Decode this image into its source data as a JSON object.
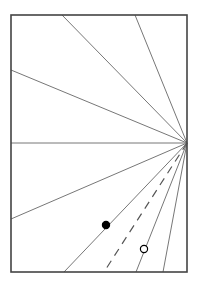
{
  "diagram": {
    "width": 201,
    "height": 283,
    "frame": {
      "x1": 11,
      "y1": 15,
      "x2": 187,
      "y2": 272,
      "stroke": "#444444",
      "stroke_width": 1.6
    },
    "apex": {
      "x": 187,
      "y": 143
    },
    "rays": [
      {
        "end": [
          62,
          15
        ],
        "style": "solid"
      },
      {
        "end": [
          135,
          15
        ],
        "style": "solid"
      },
      {
        "end": [
          11,
          70
        ],
        "style": "solid"
      },
      {
        "end": [
          11,
          143
        ],
        "style": "solid"
      },
      {
        "end": [
          11,
          219
        ],
        "style": "solid"
      },
      {
        "end": [
          64,
          272
        ],
        "style": "solid"
      },
      {
        "end": [
          104,
          272
        ],
        "style": "dashed"
      },
      {
        "end": [
          136,
          272
        ],
        "style": "solid"
      },
      {
        "end": [
          163,
          272
        ],
        "style": "solid"
      }
    ],
    "points": [
      {
        "name": "filled-point",
        "x": 106,
        "y": 225,
        "r": 3.6,
        "filled": true
      },
      {
        "name": "open-point",
        "x": 144,
        "y": 249,
        "r": 3.6,
        "filled": false
      }
    ],
    "ray_color": "#777777",
    "point_color": "#000000"
  }
}
